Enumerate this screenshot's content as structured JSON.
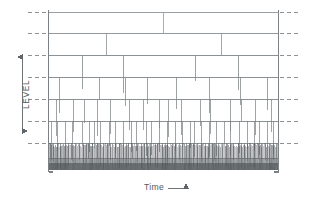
{
  "figure": {
    "kind": "hierarchical-cascade-diagram",
    "background_color": "#ffffff",
    "width": 316,
    "height": 201
  },
  "axes": {
    "y": {
      "label": "LEVEL",
      "arrow_style": "double-headed",
      "arrow_top_y": 57,
      "arrow_bottom_y": 131,
      "arrow_x": 22,
      "line_color": "#6f7477"
    },
    "x": {
      "label": "Time",
      "arrow_glyph": "⟶",
      "arrow_style": "single-headed-right",
      "line_color": "#6f7477"
    }
  },
  "plot": {
    "left": 48,
    "right": 278,
    "top": 12,
    "bottom": 170,
    "frame_color": "#7b8184",
    "frame_width": 1.1,
    "left_spine_y0": 10,
    "left_spine_y1": 172,
    "right_spine_y0": 10,
    "right_spine_y1": 172,
    "foot_tick_length": 5
  },
  "chart_data": {
    "type": "diagram",
    "title": "",
    "xlabel": "Time",
    "ylabel": "LEVEL",
    "grid": "dashed-level-ticks",
    "xlim": [
      48,
      278
    ],
    "ylim_pixels": [
      12,
      170
    ],
    "level_ticks_y": [
      12,
      33,
      55,
      77,
      99,
      121,
      143
    ],
    "level_count": 7,
    "branch_counts_per_level": [
      1,
      2,
      4,
      8,
      16,
      32,
      64,
      128
    ],
    "tick_dash_color": "#8d9295",
    "tick_dash_pattern": "4 3",
    "tick_outer_left_x0": 28,
    "tick_outer_left_x1": 46,
    "tick_outer_right_x0": 280,
    "tick_outer_right_x1": 300,
    "levels": [
      {
        "index": 0,
        "y": 12,
        "branches": 1,
        "line_color": "#9aa0a3",
        "line_width": 1.0
      },
      {
        "index": 1,
        "y": 33,
        "branches": 2,
        "line_color": "#93999c",
        "line_width": 1.0
      },
      {
        "index": 2,
        "y": 55,
        "branches": 4,
        "line_color": "#8b9194",
        "line_width": 1.0
      },
      {
        "index": 3,
        "y": 77,
        "branches": 8,
        "line_color": "#858b8e",
        "line_width": 0.95
      },
      {
        "index": 4,
        "y": 99,
        "branches": 16,
        "line_color": "#7f8588",
        "line_width": 0.9
      },
      {
        "index": 5,
        "y": 121,
        "branches": 32,
        "line_color": "#797f82",
        "line_width": 0.85
      },
      {
        "index": 6,
        "y": 143,
        "branches": 64,
        "line_color": "#6e7477",
        "line_width": 0.8
      },
      {
        "index": 7,
        "y": 158,
        "branches": 128,
        "line_color": "#5d6366",
        "line_width": 0.7
      }
    ],
    "dense_band": {
      "y_top": 158,
      "y_bottom": 170,
      "x_left": 48,
      "x_right": 278,
      "fill_color": "#9a9fa2",
      "hatch_color": "#4b5053",
      "hatch_count": 230,
      "note": "lowest-level leaves merge into a solid dark hatched band"
    }
  }
}
